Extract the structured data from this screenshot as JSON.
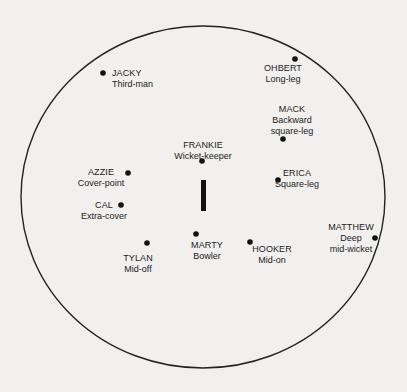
{
  "diagram": {
    "field": {
      "shape": "ellipse",
      "center": [
        203,
        197
      ],
      "radius_x": 182,
      "radius_y": 171,
      "stroke": "#222222"
    },
    "wicket": {
      "x": 201,
      "y": 180,
      "width": 5,
      "height": 31,
      "color": "#111111"
    },
    "fielders": [
      {
        "name": "JACKY",
        "position": "Third-man",
        "dot": [
          103,
          73
        ]
      },
      {
        "name": "OHBERT",
        "position": "Long-leg",
        "dot": [
          295,
          59
        ]
      },
      {
        "name": "MACK",
        "position_lines": [
          "Backward",
          "square-leg"
        ],
        "dot": [
          283,
          139
        ]
      },
      {
        "name": "FRANKIE",
        "position": "Wicket-keeper",
        "dot": [
          202,
          161
        ]
      },
      {
        "name": "AZZIE",
        "position": "Cover-point",
        "dot": [
          128,
          173
        ]
      },
      {
        "name": "ERICA",
        "position": "Square-leg",
        "dot": [
          278,
          180
        ]
      },
      {
        "name": "CAL",
        "position": "Extra-cover",
        "dot": [
          121,
          205
        ]
      },
      {
        "name": "TYLAN",
        "position": "Mid-off",
        "dot": [
          147,
          243
        ]
      },
      {
        "name": "MARTY",
        "position": "Bowler",
        "dot": [
          196,
          234
        ]
      },
      {
        "name": "HOOKER",
        "position": "Mid-on",
        "dot": [
          250,
          242
        ]
      },
      {
        "name": "MATTHEW",
        "position_lines": [
          "Deep",
          "mid-wicket"
        ],
        "dot": [
          375,
          238
        ]
      }
    ]
  }
}
